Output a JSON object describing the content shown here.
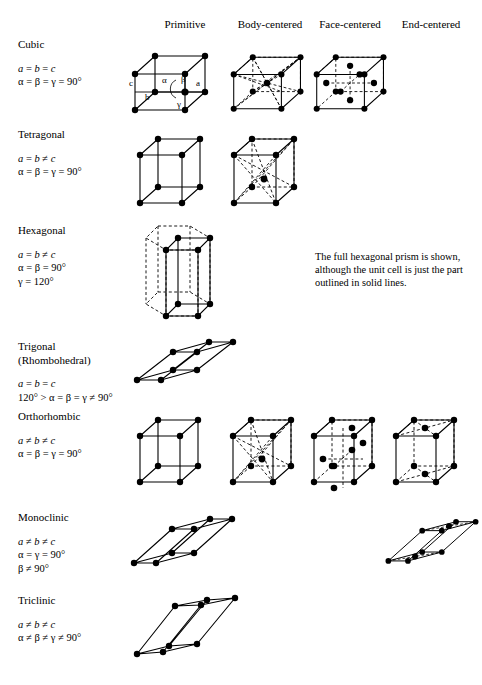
{
  "figure": {
    "columns": [
      {
        "key": "primitive",
        "label": "Primitive"
      },
      {
        "key": "body",
        "label": "Body-centered"
      },
      {
        "key": "face",
        "label": "Face-centered"
      },
      {
        "key": "end",
        "label": "End-centered"
      }
    ],
    "note": {
      "line1": "The full hexagonal prism is shown,",
      "line2": "although the unit cell is just the part",
      "line3": "outlined in solid lines."
    },
    "axis_labels": {
      "a": "a",
      "b": "b",
      "c": "c",
      "alpha": "α",
      "beta": "β",
      "gamma": "γ"
    },
    "rows": [
      {
        "key": "cubic",
        "name": "Cubic",
        "name2": "",
        "params": [
          "a = b = c",
          "α = β = γ = 90°"
        ],
        "lattices": [
          "primitive",
          "body",
          "face"
        ]
      },
      {
        "key": "tetragonal",
        "name": "Tetragonal",
        "name2": "",
        "params": [
          "a = b ≠ c",
          "α = β = γ = 90°"
        ],
        "lattices": [
          "primitive",
          "body"
        ]
      },
      {
        "key": "hexagonal",
        "name": "Hexagonal",
        "name2": "",
        "params": [
          "a = b ≠ c",
          "α = β = 90°",
          "γ = 120°"
        ],
        "lattices": [
          "primitive"
        ]
      },
      {
        "key": "trigonal",
        "name": "Trigonal",
        "name2": "(Rhombohedral)",
        "params": [
          "a = b = c",
          "120° > α = β = γ ≠ 90°"
        ],
        "lattices": [
          "primitive"
        ]
      },
      {
        "key": "orthorhombic",
        "name": "Orthorhombic",
        "name2": "",
        "params": [
          "a ≠ b ≠ c",
          "α = β = γ = 90°"
        ],
        "lattices": [
          "primitive",
          "body",
          "face",
          "end"
        ]
      },
      {
        "key": "monoclinic",
        "name": "Monoclinic",
        "name2": "",
        "params": [
          "a ≠ b ≠ c",
          "α = γ = 90°",
          "β ≠ 90°"
        ],
        "lattices": [
          "primitive",
          "end"
        ]
      },
      {
        "key": "triclinic",
        "name": "Triclinic",
        "name2": "",
        "params": [
          "a ≠ b ≠ c",
          "α ≠ β ≠ γ ≠ 90°"
        ],
        "lattices": [
          "primitive"
        ]
      }
    ]
  },
  "colors": {
    "ink": "#000000",
    "paper": "#ffffff"
  }
}
